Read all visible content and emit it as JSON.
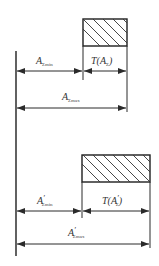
{
  "diagram": {
    "type": "dimension-chain-tolerance",
    "top": {
      "min_label": {
        "main": "A",
        "sub": "Σmin",
        "prime": ""
      },
      "tol_label": {
        "main": "T(A",
        "sub": "Σ",
        "close": ")"
      },
      "max_label": {
        "main": "A",
        "sub": "Σmax",
        "prime": ""
      }
    },
    "bottom": {
      "min_label": {
        "main": "A",
        "sub": "Σmin",
        "prime": "′"
      },
      "tol_label": {
        "main": "T(A",
        "sub": "Σ",
        "prime": "′",
        "close": ")"
      },
      "max_label": {
        "main": "A",
        "sub": "Σmax",
        "prime": "′"
      }
    }
  }
}
